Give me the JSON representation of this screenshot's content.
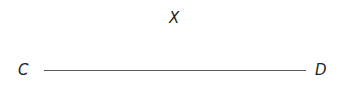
{
  "figure": {
    "background_color": "#ffffff",
    "ink_color": "#231f20",
    "line_color": "#58595b",
    "width": 340,
    "height": 87,
    "points": [
      {
        "id": "x",
        "label": "X",
        "dot_x": 159,
        "dot_y": 19,
        "label_x": 169,
        "label_y": 19,
        "label_position": "right",
        "on_segment": false
      },
      {
        "id": "c",
        "label": "C",
        "dot_x": 44,
        "dot_y": 71,
        "label_x": 24,
        "label_y": 71,
        "label_position": "left",
        "on_segment": true
      },
      {
        "id": "d",
        "label": "D",
        "dot_x": 306,
        "dot_y": 71,
        "label_x": 320,
        "label_y": 71,
        "label_position": "right",
        "on_segment": true
      }
    ],
    "segments": [
      {
        "id": "cd",
        "from": "C",
        "to": "D",
        "x1": 44,
        "y1": 71,
        "x2": 306,
        "y2": 71,
        "length_px": 262,
        "stroke_width": 1.4,
        "color": "#58595b"
      }
    ]
  }
}
